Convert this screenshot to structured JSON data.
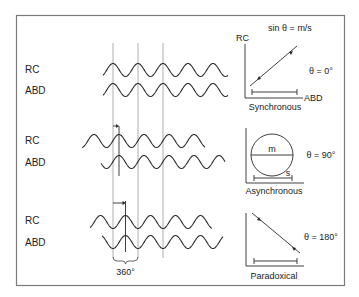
{
  "waveforms": {
    "channel_labels": {
      "rc": "RC",
      "abd": "ABD"
    },
    "groups": [
      {
        "name": "synchronous",
        "phase_shift_deg": 0,
        "rc_label": "RC",
        "abd_label": "ABD"
      },
      {
        "name": "asynchronous",
        "phase_shift_deg": 90,
        "rc_label": "RC",
        "abd_label": "ABD"
      },
      {
        "name": "paradoxical",
        "phase_shift_deg": 180,
        "rc_label": "RC",
        "abd_label": "ABD"
      }
    ],
    "period_label": "360°",
    "cycles_shown": 5
  },
  "phase_plots": {
    "formula": "sin θ = m/s",
    "y_axis_label": "RC",
    "x_axis_label": "ABD",
    "plots": [
      {
        "name": "synchronous",
        "title": "Synchronous",
        "theta_label": "θ = 0°",
        "theta_deg": 0
      },
      {
        "name": "asynchronous",
        "title": "Asynchronous",
        "theta_label": "θ = 90°",
        "theta_deg": 90,
        "m_label": "m",
        "s_label": "s"
      },
      {
        "name": "paradoxical",
        "title": "Paradoxical",
        "theta_label": "θ = 180°",
        "theta_deg": 180
      }
    ]
  },
  "colors": {
    "line": "#2a2a2a",
    "grid": "#9a9a9a",
    "frame": "#7a7a7a"
  }
}
